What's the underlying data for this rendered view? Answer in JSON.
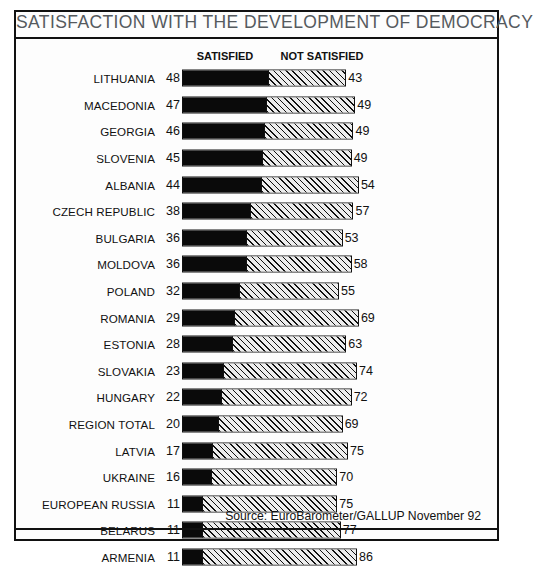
{
  "chart_title": "SATISFACTION WITH THE DEVELOPMENT OF DEMOCRACY",
  "legend": {
    "satisfied": "SATISFIED",
    "not_satisfied": "NOT SATISFIED"
  },
  "source_note": "Source: EuroBarometer/GALLUP November 92",
  "colors": {
    "satisfied_fill": "#0a0a0a",
    "not_satisfied_fill": "#ededed",
    "hatch_line": "#111111",
    "border": "#111111",
    "title_text": "#555a5e",
    "background": "#fdfdfd"
  },
  "chart_data": {
    "type": "bar",
    "orientation": "horizontal",
    "stacked": true,
    "title": "SATISFACTION WITH THE DEVELOPMENT OF DEMOCRACY",
    "subtitle": "",
    "xlabel": "",
    "ylabel": "",
    "xlim": [
      0,
      100
    ],
    "grid": false,
    "legend_position": "top",
    "units": "percent",
    "annotation": "Source: EuroBarometer/GALLUP November 92",
    "categories": [
      "LITHUANIA",
      "MACEDONIA",
      "GEORGIA",
      "SLOVENIA",
      "ALBANIA",
      "CZECH REPUBLIC",
      "BULGARIA",
      "MOLDOVA",
      "POLAND",
      "ROMANIA",
      "ESTONIA",
      "SLOVAKIA",
      "HUNGARY",
      "REGION TOTAL",
      "LATVIA",
      "UKRAINE",
      "EUROPEAN RUSSIA",
      "BELARUS",
      "ARMENIA"
    ],
    "series": [
      {
        "name": "SATISFIED",
        "values": [
          48,
          47,
          46,
          45,
          44,
          38,
          36,
          36,
          32,
          29,
          28,
          23,
          22,
          20,
          17,
          16,
          11,
          11,
          11
        ]
      },
      {
        "name": "NOT SATISFIED",
        "values": [
          43,
          49,
          49,
          49,
          54,
          57,
          53,
          58,
          55,
          69,
          63,
          74,
          72,
          69,
          75,
          70,
          75,
          77,
          86
        ]
      }
    ]
  }
}
